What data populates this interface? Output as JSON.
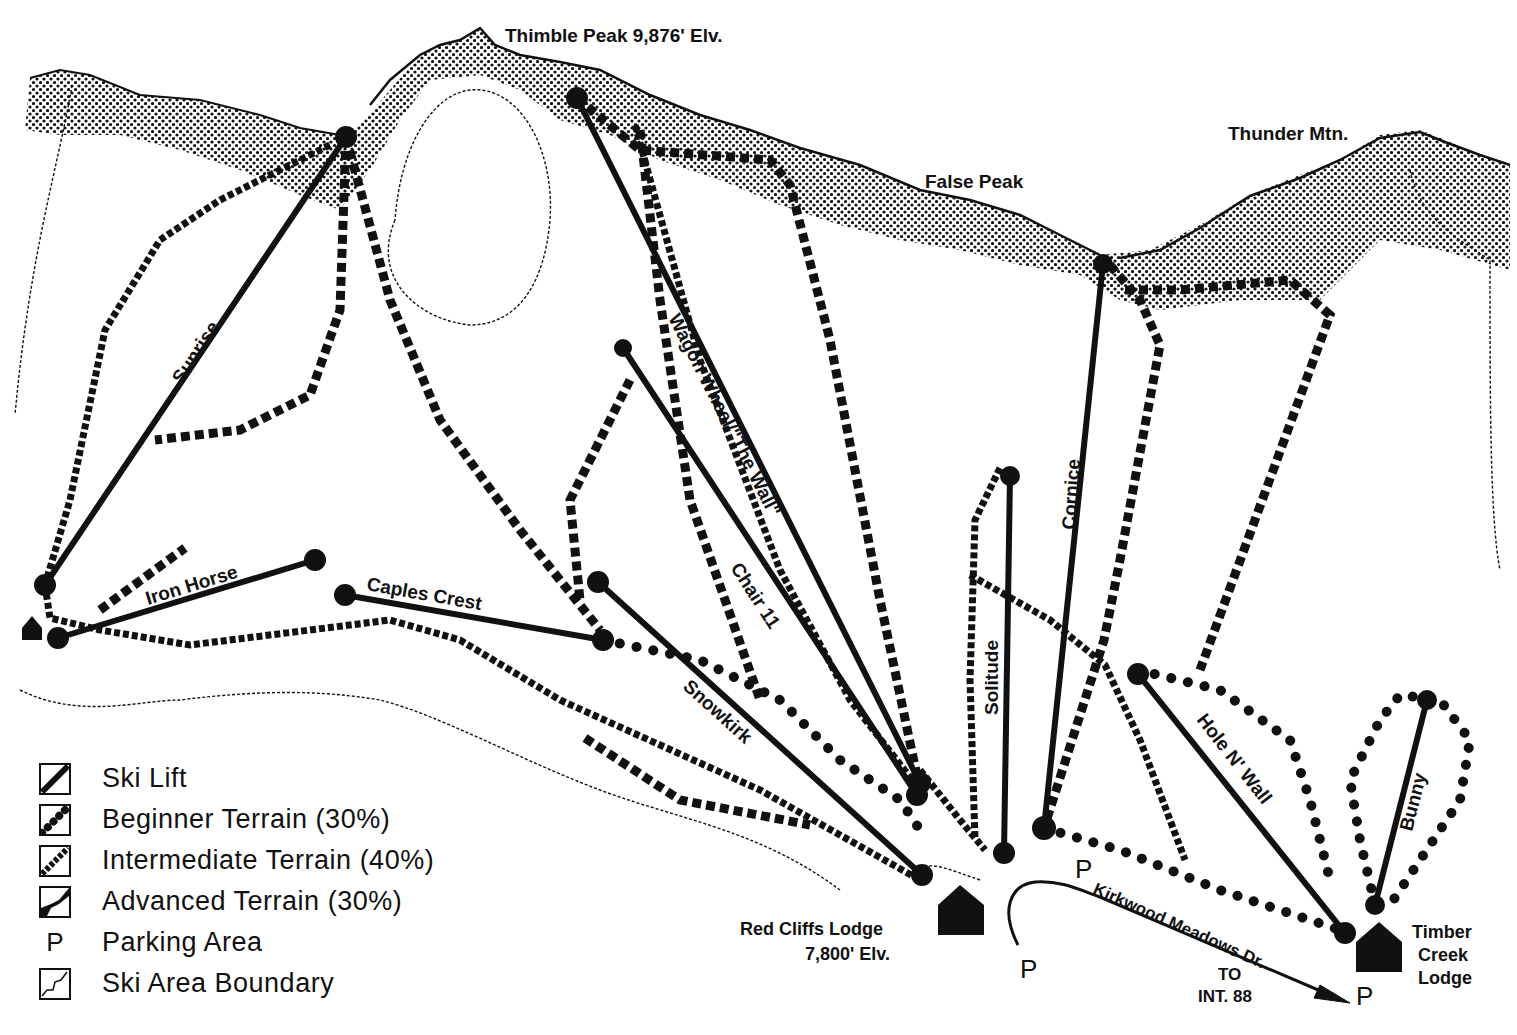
{
  "peaks": {
    "thimble": "Thimble Peak 9,876' Elv.",
    "false_peak": "False Peak",
    "thunder": "Thunder Mtn."
  },
  "lifts": [
    {
      "name": "Sunrise",
      "x1": 45,
      "y1": 585,
      "x2": 346,
      "y2": 137
    },
    {
      "name": "Iron Horse",
      "x1": 58,
      "y1": 638,
      "x2": 315,
      "y2": 560
    },
    {
      "name": "Caples Crest",
      "x1": 345,
      "y1": 595,
      "x2": 603,
      "y2": 640
    },
    {
      "name": "Snowkirk",
      "x1": 598,
      "y1": 582,
      "x2": 922,
      "y2": 875
    },
    {
      "name": "Chair 11",
      "x1": 623,
      "y1": 348,
      "x2": 917,
      "y2": 795
    },
    {
      "name": "Wagon Wheel/\"The Wall\"",
      "x1": 577,
      "y1": 98,
      "x2": 920,
      "y2": 783
    },
    {
      "name": "Solitude",
      "x1": 1010,
      "y1": 476,
      "x2": 1004,
      "y2": 853
    },
    {
      "name": "Cornice",
      "x1": 1103,
      "y1": 264,
      "x2": 1044,
      "y2": 828
    },
    {
      "name": "Hole N' Wall",
      "x1": 1138,
      "y1": 674,
      "x2": 1345,
      "y2": 933
    },
    {
      "name": "Bunny",
      "x1": 1427,
      "y1": 700,
      "x2": 1375,
      "y2": 905
    }
  ],
  "lodges": {
    "red_cliffs": {
      "name": "Red Cliffs Lodge",
      "elevation": "7,800' Elv."
    },
    "timber_creek": {
      "line1": "Timber",
      "line2": "Creek",
      "line3": "Lodge"
    }
  },
  "road": {
    "name": "Kirkwood Meadows Dr.",
    "to_line1": "TO",
    "to_line2": "INT. 88"
  },
  "parking_symbol": "P",
  "legend": {
    "items": [
      {
        "label": "Ski Lift",
        "icon": "ski-lift-icon"
      },
      {
        "label": "Beginner Terrain (30%)",
        "icon": "beginner-terrain-icon"
      },
      {
        "label": "Intermediate Terrain (40%)",
        "icon": "intermediate-terrain-icon"
      },
      {
        "label": "Advanced Terrain (30%)",
        "icon": "advanced-terrain-icon"
      },
      {
        "label": "Parking Area",
        "icon": "P"
      },
      {
        "label": "Ski Area Boundary",
        "icon": "boundary-icon"
      }
    ]
  },
  "colors": {
    "ink": "#111111",
    "paper": "#ffffff"
  }
}
